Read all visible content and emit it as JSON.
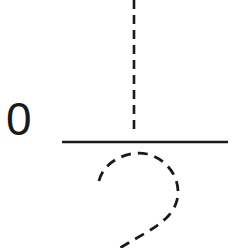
{
  "diagram": {
    "label": "0",
    "colors": {
      "stroke": "#1a1a1a",
      "background": "#ffffff"
    },
    "elements": [
      {
        "type": "dashed-vertical-line",
        "description": "vertical dashed line above the fraction bar"
      },
      {
        "type": "solid-horizontal-line",
        "description": "horizontal solid line (fraction bar)"
      },
      {
        "type": "dashed-curve",
        "description": "dashed stroke tracing the top of a numeral 2 below the line"
      }
    ]
  }
}
